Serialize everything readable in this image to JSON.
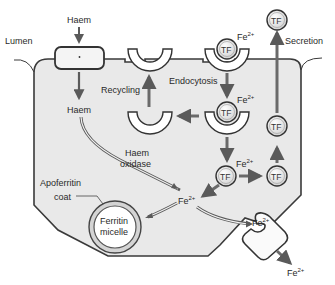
{
  "diagram": {
    "type": "iron absorption in enterocyte",
    "labels": {
      "lumen": "Lumen",
      "haem_in": "Haem",
      "haem_cell": "Haem",
      "recycling": "Recycling",
      "endocytosis": "Endocytosis",
      "secretion": "Secretion",
      "haem_oxidase_line1": "Haem",
      "haem_oxidase_line2": "oxidase",
      "apoferritin_line1": "Apoferritin",
      "apoferritin_line2": "coat",
      "ferritin_line1": "Ferritin",
      "ferritin_line2": "micelle",
      "tf": "TF",
      "fe": "Fe",
      "fe_charge": "2+"
    },
    "colors": {
      "cell_fill": "#e9e9e9",
      "outline": "#3a3a3a",
      "arrow": "#6a6a6a",
      "background": "#ffffff"
    }
  }
}
